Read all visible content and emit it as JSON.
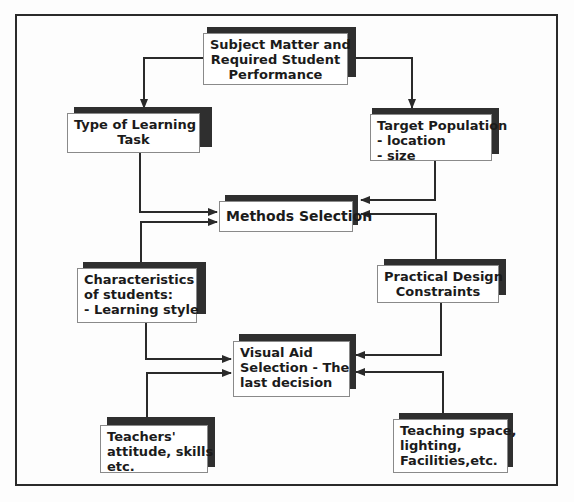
{
  "diagram": {
    "type": "flowchart",
    "nodes": [
      {
        "id": "subject",
        "lines": [
          "Subject Matter and",
          "Required Student",
          "Performance"
        ]
      },
      {
        "id": "task",
        "lines": [
          "Type of Learning",
          "Task"
        ]
      },
      {
        "id": "population",
        "lines": [
          "Target Population",
          "- location",
          "- size"
        ]
      },
      {
        "id": "methods",
        "lines": [
          "Methods Selection"
        ]
      },
      {
        "id": "characteristics",
        "lines": [
          "Characteristics",
          "of students:",
          "- Learning style"
        ]
      },
      {
        "id": "constraints",
        "lines": [
          "Practical Design",
          "Constraints"
        ]
      },
      {
        "id": "visual",
        "lines": [
          "Visual Aid",
          "Selection - The",
          "last decision"
        ]
      },
      {
        "id": "teachers",
        "lines": [
          "Teachers'",
          "attitude, skills",
          "etc."
        ]
      },
      {
        "id": "space",
        "lines": [
          "Teaching space,",
          "lighting,",
          "Facilities,etc."
        ]
      }
    ],
    "edges": [
      {
        "from": "subject",
        "to": "task"
      },
      {
        "from": "subject",
        "to": "population"
      },
      {
        "from": "task",
        "to": "methods"
      },
      {
        "from": "characteristics",
        "to": "methods"
      },
      {
        "from": "population",
        "to": "methods"
      },
      {
        "from": "constraints",
        "to": "methods"
      },
      {
        "from": "characteristics",
        "to": "visual"
      },
      {
        "from": "teachers",
        "to": "visual"
      },
      {
        "from": "constraints",
        "to": "visual"
      },
      {
        "from": "space",
        "to": "visual"
      }
    ],
    "colors": {
      "line": "#2a2a2a",
      "shadow": "#2f2f2f",
      "box": "#ffffff"
    }
  }
}
